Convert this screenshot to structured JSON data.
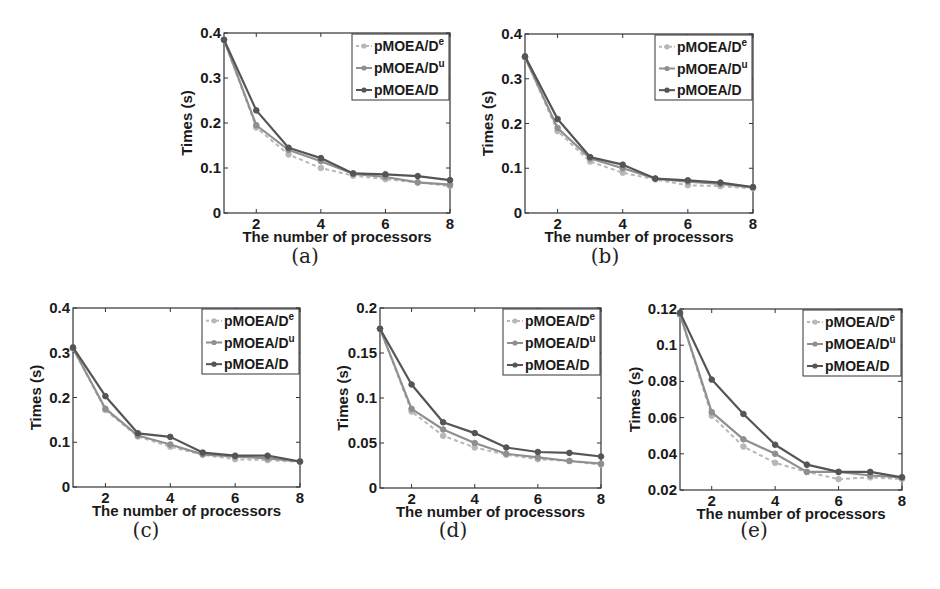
{
  "figure": {
    "legend_entries": [
      "pMOEA/D^e",
      "pMOEA/D^u",
      "pMOEA/D"
    ],
    "legend_labels": {
      "e": {
        "base": "pMOEA/D",
        "sup": "e"
      },
      "u": {
        "base": "pMOEA/D",
        "sup": "u"
      },
      "plain": {
        "base": "pMOEA/D",
        "sup": ""
      }
    },
    "colors": {
      "pMOEA/D^e": "#b8b8b8",
      "pMOEA/D^u": "#8f8f8f",
      "pMOEA/D": "#555555",
      "axis": "#333333"
    }
  },
  "chart_data": [
    {
      "id": "a",
      "type": "line",
      "caption": "(a)",
      "xlabel": "The number of processors",
      "ylabel": "Times (s)",
      "x": [
        1,
        2,
        3,
        4,
        5,
        6,
        7,
        8
      ],
      "xticks": [
        2,
        4,
        6,
        8
      ],
      "xlim": [
        1,
        8
      ],
      "ylim": [
        0,
        0.4
      ],
      "yticks": [
        0,
        0.1,
        0.2,
        0.3,
        0.4
      ],
      "ytick_labels": [
        "0",
        "0.1",
        "0.2",
        "0.3",
        "0.4"
      ],
      "legend_position": "upper right",
      "grid": false,
      "series": [
        {
          "name": "pMOEA/D^e",
          "style": "dashed",
          "values": [
            0.385,
            0.19,
            0.13,
            0.1,
            0.083,
            0.075,
            0.068,
            0.06
          ]
        },
        {
          "name": "pMOEA/D^u",
          "style": "solid",
          "values": [
            0.385,
            0.195,
            0.14,
            0.115,
            0.087,
            0.08,
            0.068,
            0.063
          ]
        },
        {
          "name": "pMOEA/D",
          "style": "solid",
          "values": [
            0.385,
            0.228,
            0.145,
            0.122,
            0.088,
            0.086,
            0.082,
            0.073
          ]
        }
      ]
    },
    {
      "id": "b",
      "type": "line",
      "caption": "(b)",
      "xlabel": "The number of processors",
      "ylabel": "Times (s)",
      "x": [
        1,
        2,
        3,
        4,
        5,
        6,
        7,
        8
      ],
      "xticks": [
        2,
        4,
        6,
        8
      ],
      "xlim": [
        1,
        8
      ],
      "ylim": [
        0,
        0.4
      ],
      "yticks": [
        0,
        0.1,
        0.2,
        0.3,
        0.4
      ],
      "ytick_labels": [
        "0",
        "0.1",
        "0.2",
        "0.3",
        "0.4"
      ],
      "legend_position": "upper right",
      "grid": false,
      "series": [
        {
          "name": "pMOEA/D^e",
          "style": "dashed",
          "values": [
            0.348,
            0.183,
            0.115,
            0.09,
            0.075,
            0.062,
            0.06,
            0.055
          ]
        },
        {
          "name": "pMOEA/D^u",
          "style": "solid",
          "values": [
            0.348,
            0.19,
            0.122,
            0.1,
            0.077,
            0.07,
            0.065,
            0.057
          ]
        },
        {
          "name": "pMOEA/D",
          "style": "solid",
          "values": [
            0.35,
            0.21,
            0.125,
            0.108,
            0.077,
            0.073,
            0.068,
            0.058
          ]
        }
      ]
    },
    {
      "id": "c",
      "type": "line",
      "caption": "(c)",
      "xlabel": "The number of processors",
      "ylabel": "Times (s)",
      "x": [
        1,
        2,
        3,
        4,
        5,
        6,
        7,
        8
      ],
      "xticks": [
        2,
        4,
        6,
        8
      ],
      "xlim": [
        1,
        8
      ],
      "ylim": [
        0,
        0.4
      ],
      "yticks": [
        0,
        0.1,
        0.2,
        0.3,
        0.4
      ],
      "ytick_labels": [
        "0",
        "0.1",
        "0.2",
        "0.3",
        "0.4"
      ],
      "legend_position": "upper right",
      "grid": false,
      "series": [
        {
          "name": "pMOEA/D^e",
          "style": "dashed",
          "values": [
            0.31,
            0.172,
            0.113,
            0.09,
            0.072,
            0.062,
            0.06,
            0.056
          ]
        },
        {
          "name": "pMOEA/D^u",
          "style": "solid",
          "values": [
            0.31,
            0.175,
            0.115,
            0.095,
            0.073,
            0.068,
            0.064,
            0.057
          ]
        },
        {
          "name": "pMOEA/D",
          "style": "solid",
          "values": [
            0.312,
            0.203,
            0.12,
            0.112,
            0.077,
            0.07,
            0.07,
            0.057
          ]
        }
      ]
    },
    {
      "id": "d",
      "type": "line",
      "caption": "(d)",
      "xlabel": "The number of processors",
      "ylabel": "Times (s)",
      "x": [
        1,
        2,
        3,
        4,
        5,
        6,
        7,
        8
      ],
      "xticks": [
        2,
        4,
        6,
        8
      ],
      "xlim": [
        1,
        8
      ],
      "ylim": [
        0,
        0.2
      ],
      "yticks": [
        0,
        0.05,
        0.1,
        0.15,
        0.2
      ],
      "ytick_labels": [
        "0",
        "0.05",
        "0.1",
        "0.15",
        "0.2"
      ],
      "legend_position": "upper right",
      "grid": false,
      "series": [
        {
          "name": "pMOEA/D^e",
          "style": "dashed",
          "values": [
            0.177,
            0.085,
            0.058,
            0.045,
            0.037,
            0.032,
            0.03,
            0.026
          ]
        },
        {
          "name": "pMOEA/D^u",
          "style": "solid",
          "values": [
            0.177,
            0.088,
            0.065,
            0.05,
            0.038,
            0.034,
            0.03,
            0.027
          ]
        },
        {
          "name": "pMOEA/D",
          "style": "solid",
          "values": [
            0.177,
            0.115,
            0.073,
            0.061,
            0.045,
            0.04,
            0.039,
            0.035
          ]
        }
      ]
    },
    {
      "id": "e",
      "type": "line",
      "caption": "(e)",
      "xlabel": "The number of processors",
      "ylabel": "Times (s)",
      "x": [
        1,
        2,
        3,
        4,
        5,
        6,
        7,
        8
      ],
      "xticks": [
        2,
        4,
        6,
        8
      ],
      "xlim": [
        1,
        8
      ],
      "ylim": [
        0.02,
        0.12
      ],
      "yticks": [
        0.02,
        0.04,
        0.06,
        0.08,
        0.1,
        0.12
      ],
      "ytick_labels": [
        "0.02",
        "0.04",
        "0.06",
        "0.08",
        "0.1",
        "0.12"
      ],
      "legend_position": "upper right",
      "grid": false,
      "series": [
        {
          "name": "pMOEA/D^e",
          "style": "dashed",
          "values": [
            0.117,
            0.061,
            0.044,
            0.035,
            0.03,
            0.026,
            0.027,
            0.026
          ]
        },
        {
          "name": "pMOEA/D^u",
          "style": "solid",
          "values": [
            0.117,
            0.063,
            0.048,
            0.04,
            0.03,
            0.03,
            0.028,
            0.027
          ]
        },
        {
          "name": "pMOEA/D",
          "style": "solid",
          "values": [
            0.118,
            0.081,
            0.062,
            0.045,
            0.034,
            0.03,
            0.03,
            0.027
          ]
        }
      ]
    }
  ],
  "layout": {
    "panels": [
      {
        "id": "a",
        "box": {
          "left": 224,
          "top": 33,
          "right": 450,
          "bottom": 213
        },
        "caption_pos": {
          "x": 305,
          "y": 258
        },
        "legend": {
          "left": 352,
          "top": 34,
          "right": 449,
          "bottom": 100
        }
      },
      {
        "id": "b",
        "box": {
          "left": 525,
          "top": 34,
          "right": 753,
          "bottom": 213
        },
        "caption_pos": {
          "x": 605,
          "y": 258
        },
        "legend": {
          "left": 655,
          "top": 35,
          "right": 752,
          "bottom": 100
        }
      },
      {
        "id": "c",
        "box": {
          "left": 73,
          "top": 308,
          "right": 300,
          "bottom": 487
        },
        "caption_pos": {
          "x": 146,
          "y": 532
        },
        "legend": {
          "left": 202,
          "top": 309,
          "right": 299,
          "bottom": 374
        }
      },
      {
        "id": "d",
        "box": {
          "left": 380,
          "top": 308,
          "right": 601,
          "bottom": 488
        },
        "caption_pos": {
          "x": 453,
          "y": 532
        },
        "legend": {
          "left": 503,
          "top": 309,
          "right": 600,
          "bottom": 375
        }
      },
      {
        "id": "e",
        "box": {
          "left": 680,
          "top": 309,
          "right": 902,
          "bottom": 490
        },
        "caption_pos": {
          "x": 754,
          "y": 532
        },
        "legend": {
          "left": 803,
          "top": 310,
          "right": 901,
          "bottom": 376
        }
      }
    ]
  }
}
